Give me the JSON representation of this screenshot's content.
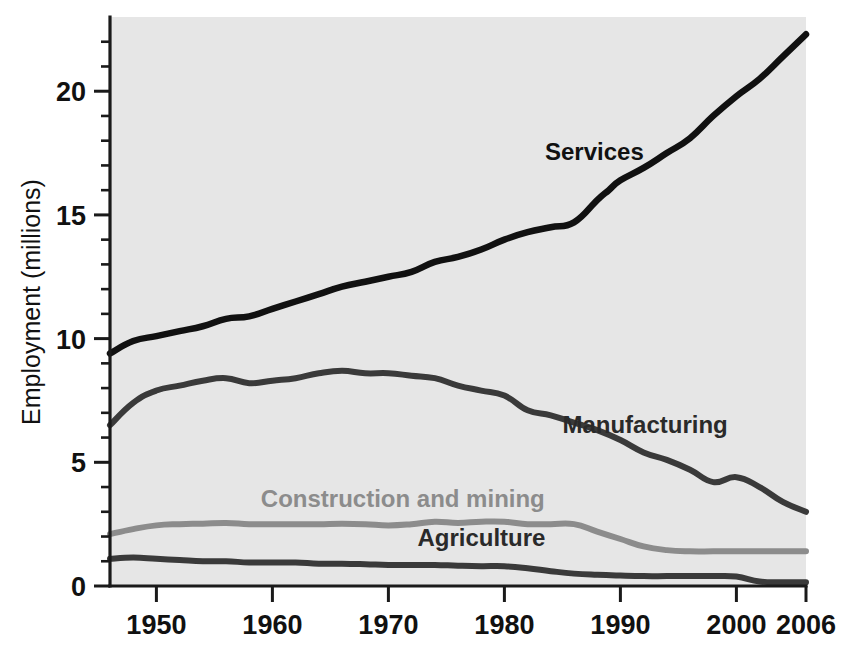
{
  "chart_data": {
    "type": "line",
    "title": "",
    "subtitle": "",
    "xlabel": "",
    "ylabel": "Employment (millions)",
    "xlim": [
      1946,
      2006
    ],
    "ylim": [
      0,
      23
    ],
    "grid": false,
    "legend_position": "inline-labels",
    "x_ticks": [
      1950,
      1960,
      1970,
      1980,
      1990,
      2000,
      2006
    ],
    "x_tick_labels": [
      "1950",
      "1960",
      "1970",
      "1980",
      "1990",
      "2000",
      "2006"
    ],
    "y_ticks": [
      0,
      5,
      10,
      15,
      20
    ],
    "y_tick_labels": [
      "0",
      "5",
      "10",
      "15",
      "20"
    ],
    "y_minor_ticks": [
      1,
      2,
      3,
      4,
      6,
      7,
      8,
      9,
      11,
      12,
      13,
      14,
      16,
      17,
      18,
      19,
      21,
      22
    ],
    "plot_background": "#e6e6e6",
    "series": [
      {
        "name": "Services",
        "label": "Services",
        "color": "#111111",
        "label_color": "#111111",
        "stroke_width": 6.5,
        "x": [
          1946,
          1948,
          1950,
          1952,
          1954,
          1956,
          1958,
          1960,
          1962,
          1964,
          1966,
          1968,
          1970,
          1972,
          1974,
          1976,
          1978,
          1980,
          1982,
          1984,
          1986,
          1988,
          1989,
          1990,
          1992,
          1994,
          1996,
          1998,
          2000,
          2002,
          2004,
          2006
        ],
        "y": [
          9.4,
          9.9,
          10.1,
          10.3,
          10.5,
          10.8,
          10.9,
          11.2,
          11.5,
          11.8,
          12.1,
          12.3,
          12.5,
          12.7,
          13.1,
          13.3,
          13.6,
          14.0,
          14.3,
          14.5,
          14.7,
          15.6,
          16.0,
          16.4,
          16.9,
          17.5,
          18.1,
          19.0,
          19.8,
          20.5,
          21.4,
          22.3
        ]
      },
      {
        "name": "Manufacturing",
        "label": "Manufacturing",
        "color": "#3a3a3a",
        "label_color": "#2a2a2a",
        "stroke_width": 6.0,
        "x": [
          1946,
          1948,
          1950,
          1952,
          1954,
          1956,
          1958,
          1960,
          1962,
          1964,
          1966,
          1968,
          1970,
          1972,
          1974,
          1976,
          1978,
          1980,
          1982,
          1984,
          1986,
          1988,
          1990,
          1992,
          1994,
          1996,
          1998,
          2000,
          2002,
          2004,
          2006
        ],
        "y": [
          6.5,
          7.4,
          7.9,
          8.1,
          8.3,
          8.4,
          8.2,
          8.3,
          8.4,
          8.6,
          8.7,
          8.6,
          8.6,
          8.5,
          8.4,
          8.1,
          7.9,
          7.7,
          7.1,
          6.9,
          6.6,
          6.3,
          5.9,
          5.4,
          5.1,
          4.7,
          4.2,
          4.4,
          4.0,
          3.4,
          3.0
        ]
      },
      {
        "name": "Construction and mining",
        "label": "Construction and mining",
        "color": "#8c8c8c",
        "label_color": "#8c8c8c",
        "stroke_width": 6.0,
        "x": [
          1946,
          1948,
          1950,
          1952,
          1954,
          1956,
          1958,
          1960,
          1962,
          1964,
          1966,
          1968,
          1970,
          1972,
          1974,
          1976,
          1978,
          1980,
          1982,
          1984,
          1986,
          1988,
          1990,
          1992,
          1994,
          1996,
          1998,
          2000,
          2002,
          2004,
          2006
        ],
        "y": [
          2.1,
          2.3,
          2.45,
          2.5,
          2.52,
          2.55,
          2.5,
          2.5,
          2.5,
          2.5,
          2.52,
          2.5,
          2.45,
          2.5,
          2.6,
          2.55,
          2.6,
          2.6,
          2.5,
          2.5,
          2.5,
          2.2,
          1.9,
          1.6,
          1.45,
          1.4,
          1.4,
          1.4,
          1.4,
          1.4,
          1.4
        ]
      },
      {
        "name": "Agriculture",
        "label": "Agriculture",
        "color": "#3a3a3a",
        "label_color": "#2a2a2a",
        "stroke_width": 6.0,
        "x": [
          1946,
          1948,
          1950,
          1952,
          1954,
          1956,
          1958,
          1960,
          1962,
          1964,
          1966,
          1968,
          1970,
          1972,
          1974,
          1976,
          1978,
          1980,
          1982,
          1984,
          1986,
          1988,
          1990,
          1992,
          1994,
          1996,
          1998,
          2000,
          2002,
          2004,
          2006
        ],
        "y": [
          1.1,
          1.15,
          1.1,
          1.05,
          1.0,
          1.0,
          0.95,
          0.95,
          0.95,
          0.9,
          0.9,
          0.88,
          0.85,
          0.85,
          0.85,
          0.82,
          0.8,
          0.8,
          0.72,
          0.6,
          0.5,
          0.45,
          0.42,
          0.4,
          0.4,
          0.4,
          0.4,
          0.38,
          0.18,
          0.15,
          0.15
        ]
      }
    ],
    "annotations": [
      {
        "text": "Services",
        "x": 1983.5,
        "y": 17.2
      },
      {
        "text": "Manufacturing",
        "x": 1985.0,
        "y": 6.2
      },
      {
        "text": "Construction and mining",
        "x": 1959.0,
        "y": 3.2
      },
      {
        "text": "Agriculture",
        "x": 1972.5,
        "y": 1.6
      }
    ]
  },
  "axis": {
    "y_title": "Employment (millions)"
  }
}
